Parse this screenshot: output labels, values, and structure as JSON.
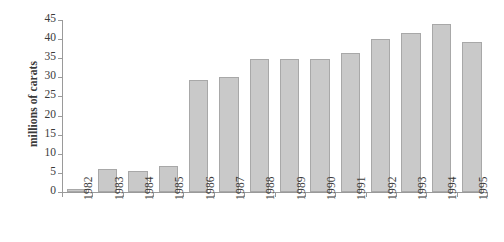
{
  "chart_data": {
    "type": "bar",
    "title": "",
    "xlabel": "",
    "ylabel": "millions of carats",
    "categories": [
      "1982",
      "1983",
      "1984",
      "1985",
      "1986",
      "1987",
      "1988",
      "1989",
      "1990",
      "1991",
      "1992",
      "1993",
      "1994",
      "1995"
    ],
    "values": [
      0.7,
      6.1,
      5.4,
      6.9,
      29.3,
      30.1,
      34.8,
      34.8,
      34.8,
      36.3,
      40.1,
      41.5,
      43.9,
      39.3
    ],
    "ylim": [
      0,
      45
    ],
    "ytick_values": [
      0,
      5,
      10,
      15,
      20,
      25,
      30,
      35,
      40,
      45
    ],
    "ytick_labels": [
      "0",
      "5",
      "10",
      "15",
      "20",
      "25",
      "30",
      "35",
      "40",
      "45"
    ],
    "grid": false,
    "legend": null,
    "bar_color": "#c9c9c9",
    "bar_edge_color": "#a8a8a8",
    "axis_color": "#9a9a9a",
    "text_color": "#3a3a3a",
    "background": "#ffffff"
  }
}
